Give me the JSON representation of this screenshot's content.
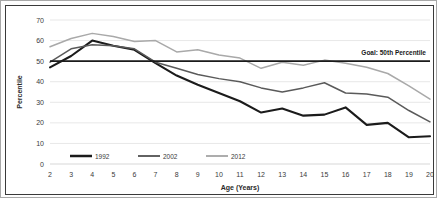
{
  "chart_data": {
    "type": "line",
    "title": "",
    "xlabel": "Age (Years)",
    "ylabel": "Percentile",
    "x": [
      2,
      3,
      4,
      5,
      6,
      7,
      8,
      9,
      10,
      11,
      12,
      13,
      14,
      15,
      16,
      17,
      18,
      19,
      20
    ],
    "xtick_labels": [
      "2",
      "3",
      "4",
      "5",
      "6",
      "7",
      "8",
      "9",
      "10",
      "11",
      "12",
      "13",
      "14",
      "15",
      "16",
      "17",
      "18",
      "19",
      "20"
    ],
    "ytick_labels": [
      "0",
      "10",
      "20",
      "30",
      "40",
      "50",
      "60",
      "70"
    ],
    "yticks": [
      0,
      10,
      20,
      30,
      40,
      50,
      60,
      70
    ],
    "ylim": [
      0,
      70
    ],
    "xlim": [
      2,
      20
    ],
    "grid": "horizontal",
    "legend_position": "bottom-left",
    "series": [
      {
        "name": "1992",
        "color": "#1b1b1b",
        "width": 2.1,
        "values": [
          47,
          52.5,
          60,
          57.5,
          55.5,
          49,
          43,
          38.5,
          34.5,
          30.5,
          25,
          27,
          23.5,
          24,
          27.5,
          19,
          20,
          13,
          13.5
        ]
      },
      {
        "name": "2002",
        "color": "#5a5a5a",
        "width": 1.5,
        "values": [
          49.5,
          56,
          58,
          57.5,
          56,
          49.5,
          46.5,
          43.5,
          41.5,
          40,
          37,
          35,
          37,
          39.5,
          34.5,
          34,
          32.5,
          26,
          20.5
        ]
      },
      {
        "name": "2012",
        "color": "#a9a9a9",
        "width": 1.5,
        "values": [
          57,
          61,
          63.5,
          62,
          59.5,
          60,
          54.5,
          55.5,
          53,
          51.5,
          46.5,
          49.5,
          48,
          50.5,
          49,
          47,
          44,
          38,
          31.5
        ]
      }
    ],
    "annotations": [
      {
        "name": "goal-line",
        "label": "Goal: 50th Percentile",
        "value": 50,
        "color": "#1b1b1b"
      }
    ]
  },
  "legend": {
    "items": [
      {
        "label": "1992"
      },
      {
        "label": "2002"
      },
      {
        "label": "2012"
      }
    ]
  }
}
